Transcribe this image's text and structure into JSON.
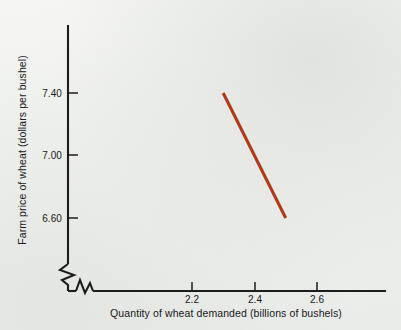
{
  "chart_data": {
    "type": "line",
    "title": "",
    "subtitle": "",
    "xlabel": "Quantity of wheat demanded (billions of bushels)",
    "ylabel": "Farm price of wheat (dollars per bushel)",
    "xlim": [
      2.1,
      2.75
    ],
    "ylim": [
      6.4,
      7.62
    ],
    "xticks": [
      "2.2",
      "2.4",
      "2.6"
    ],
    "xtick_values": [
      2.2,
      2.4,
      2.6
    ],
    "yticks": [
      "7.40",
      "7.00",
      "6.60"
    ],
    "ytick_values": [
      7.4,
      7.0,
      6.6
    ],
    "grid": false,
    "legend": "none",
    "axis_break_x": true,
    "axis_break_y": true,
    "series": [
      {
        "name": "Demand curve",
        "color": "#b0391a",
        "x": [
          2.3,
          2.5
        ],
        "values": [
          7.4,
          6.6
        ]
      }
    ],
    "annotations": []
  },
  "colors": {
    "background": "#eef0ee",
    "axis": "#1c1c1c",
    "text": "#18181a",
    "curve": "#b0391a"
  },
  "geometry": {
    "y_axis_x": 68,
    "y_axis_top": 25,
    "y_axis_bottom": 265,
    "x_axis_y": 291,
    "x_axis_left": 68,
    "x_axis_right": 386,
    "ytick_py": [
      93,
      155,
      218
    ],
    "xtick_px": [
      192,
      255,
      317
    ],
    "curve_px": [
      [
        222,
        93
      ],
      [
        285,
        218
      ]
    ]
  }
}
